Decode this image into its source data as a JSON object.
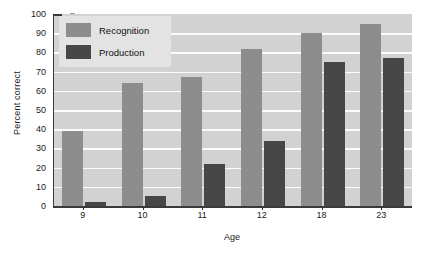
{
  "chart_data": {
    "type": "bar",
    "title": "",
    "xlabel": "Age",
    "ylabel": "Percent correct",
    "categories": [
      "9",
      "10",
      "11",
      "12",
      "18",
      "23"
    ],
    "series": [
      {
        "name": "Recognition",
        "color": "#8d8d8d",
        "values": [
          39,
          64,
          67,
          82,
          90,
          95
        ]
      },
      {
        "name": "Production",
        "color": "#474747",
        "values": [
          2,
          5,
          22,
          34,
          75,
          77
        ]
      }
    ],
    "ylim": [
      0,
      100
    ],
    "yticks": [
      0,
      10,
      20,
      30,
      40,
      50,
      60,
      70,
      80,
      90,
      100
    ],
    "ytick_labels": [
      "0",
      "10",
      "20",
      "30",
      "40",
      "50",
      "60",
      "70",
      "80",
      "90",
      "100"
    ],
    "grid": true,
    "grid_axis": "y",
    "grid_color": "#fbfbfb",
    "legend_position": "upper left",
    "plot_background": "#d2d2d2",
    "figure_background": "#ffffff"
  },
  "legend": {
    "items": [
      {
        "label": "Recognition",
        "swatch": "recognition-swatch"
      },
      {
        "label": "Production",
        "swatch": "production-swatch"
      }
    ]
  }
}
